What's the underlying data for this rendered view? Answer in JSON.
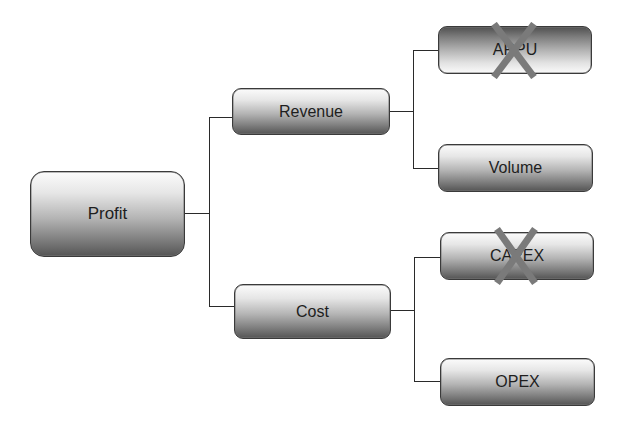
{
  "diagram": {
    "type": "tree",
    "colors": {
      "line": "#2a2a2a",
      "node_border": "#3a3a3a",
      "node_gradient_light": "#fbfbfb",
      "node_gradient_dark": "#555555",
      "cross_mark": "#7a7a7a",
      "text": "#1e1e1e"
    },
    "root": {
      "label": "Profit"
    },
    "branches": [
      {
        "label": "Revenue",
        "children": [
          {
            "label": "ARPU",
            "crossed_out": true,
            "gradient": "inverted",
            "mark_icon": "x-mark"
          },
          {
            "label": "Volume",
            "crossed_out": false,
            "gradient": "normal"
          }
        ]
      },
      {
        "label": "Cost",
        "children": [
          {
            "label": "CAPEX",
            "crossed_out": true,
            "gradient": "normal",
            "mark_icon": "x-mark"
          },
          {
            "label": "OPEX",
            "crossed_out": false,
            "gradient": "normal"
          }
        ]
      }
    ]
  }
}
